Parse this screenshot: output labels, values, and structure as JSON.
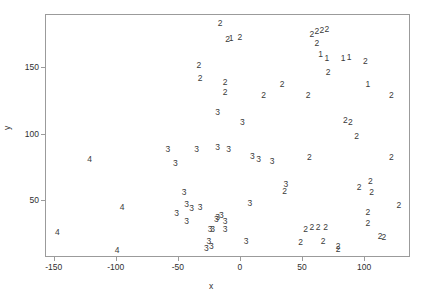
{
  "chart_data": {
    "type": "scatter",
    "title": "",
    "xlabel": "x",
    "ylabel": "y",
    "xlim": [
      -157,
      137
    ],
    "ylim": [
      7,
      190
    ],
    "xticks": [
      -150,
      -100,
      -50,
      0,
      50,
      100
    ],
    "xticklabels": [
      "-150",
      "-100",
      "-50",
      "0",
      "50",
      "100"
    ],
    "yticks": [
      50,
      100,
      150
    ],
    "yticklabels": [
      "50",
      "100",
      "150"
    ],
    "grid": false,
    "legend": null,
    "marker_style": "text-label-cluster-id",
    "series": [
      {
        "name": "1",
        "label": "1",
        "points": [
          {
            "x": -7,
            "y": 172
          },
          {
            "x": 65,
            "y": 160
          },
          {
            "x": 70,
            "y": 157
          },
          {
            "x": 83,
            "y": 157
          },
          {
            "x": 88,
            "y": 158
          },
          {
            "x": 103,
            "y": 137
          }
        ]
      },
      {
        "name": "2",
        "label": "2",
        "points": [
          {
            "x": -16,
            "y": 183
          },
          {
            "x": -10,
            "y": 171
          },
          {
            "x": 0,
            "y": 173
          },
          {
            "x": 58,
            "y": 175
          },
          {
            "x": 62,
            "y": 177
          },
          {
            "x": 66,
            "y": 178
          },
          {
            "x": 70,
            "y": 179
          },
          {
            "x": 62,
            "y": 168
          },
          {
            "x": 101,
            "y": 155
          },
          {
            "x": -33,
            "y": 152
          },
          {
            "x": -32,
            "y": 142
          },
          {
            "x": 71,
            "y": 146
          },
          {
            "x": -12,
            "y": 139
          },
          {
            "x": -12,
            "y": 131
          },
          {
            "x": 34,
            "y": 137
          },
          {
            "x": 19,
            "y": 129
          },
          {
            "x": 55,
            "y": 129
          },
          {
            "x": 122,
            "y": 129
          },
          {
            "x": 85,
            "y": 110
          },
          {
            "x": 89,
            "y": 109
          },
          {
            "x": 94,
            "y": 98
          },
          {
            "x": 56,
            "y": 82
          },
          {
            "x": 122,
            "y": 82
          },
          {
            "x": 36,
            "y": 57
          },
          {
            "x": 96,
            "y": 60
          },
          {
            "x": 105,
            "y": 64
          },
          {
            "x": 106,
            "y": 56
          },
          {
            "x": 128,
            "y": 46
          },
          {
            "x": 103,
            "y": 41
          },
          {
            "x": 103,
            "y": 33
          },
          {
            "x": 53,
            "y": 28
          },
          {
            "x": 58,
            "y": 30
          },
          {
            "x": 63,
            "y": 30
          },
          {
            "x": 69,
            "y": 30
          },
          {
            "x": 67,
            "y": 19
          },
          {
            "x": 49,
            "y": 18
          },
          {
            "x": 113,
            "y": 23
          },
          {
            "x": 116,
            "y": 22
          },
          {
            "x": 79,
            "y": 15
          },
          {
            "x": 79,
            "y": 13
          }
        ]
      },
      {
        "name": "3",
        "label": "3",
        "points": [
          {
            "x": -18,
            "y": 116
          },
          {
            "x": 2,
            "y": 109
          },
          {
            "x": -18,
            "y": 90
          },
          {
            "x": -9,
            "y": 88
          },
          {
            "x": 10,
            "y": 83
          },
          {
            "x": 15,
            "y": 81
          },
          {
            "x": 26,
            "y": 79
          },
          {
            "x": -58,
            "y": 88
          },
          {
            "x": -35,
            "y": 88
          },
          {
            "x": -52,
            "y": 78
          },
          {
            "x": 37,
            "y": 62
          },
          {
            "x": -45,
            "y": 56
          },
          {
            "x": -43,
            "y": 47
          },
          {
            "x": -39,
            "y": 44
          },
          {
            "x": -32,
            "y": 45
          },
          {
            "x": -51,
            "y": 40
          },
          {
            "x": -43,
            "y": 34
          },
          {
            "x": 8,
            "y": 48
          },
          {
            "x": -15,
            "y": 39
          },
          {
            "x": -18,
            "y": 37
          },
          {
            "x": -19,
            "y": 36
          },
          {
            "x": -12,
            "y": 34
          },
          {
            "x": -24,
            "y": 28
          },
          {
            "x": -22,
            "y": 28
          },
          {
            "x": -12,
            "y": 28
          },
          {
            "x": -25,
            "y": 19
          },
          {
            "x": -23,
            "y": 15
          },
          {
            "x": -27,
            "y": 14
          },
          {
            "x": 5,
            "y": 19
          }
        ]
      },
      {
        "name": "4",
        "label": "4",
        "points": [
          {
            "x": -121,
            "y": 81
          },
          {
            "x": -147,
            "y": 26
          },
          {
            "x": -95,
            "y": 45
          },
          {
            "x": -99,
            "y": 12
          }
        ]
      }
    ]
  },
  "axis": {
    "x_label": "x",
    "y_label": "y"
  }
}
